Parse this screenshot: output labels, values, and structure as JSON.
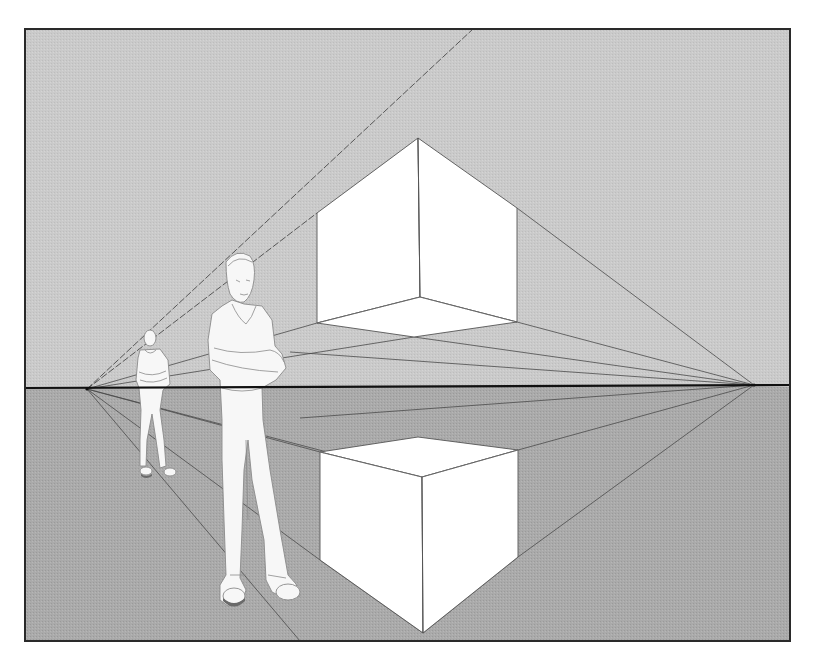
{
  "figure": {
    "colors": {
      "background": "#ffffff",
      "sky": "#c9c9c9",
      "ground": "#a9a9a9",
      "frame": "#2a2a2a",
      "horizon": "#111111",
      "cube_face": "#ffffff",
      "guide_line": "#4a4a4a"
    },
    "frame": {
      "left": 25,
      "top": 29,
      "right": 790,
      "bottom": 641
    },
    "horizon_y": 387,
    "vanishing_points": {
      "left": {
        "x": 87,
        "y": 389
      },
      "right": {
        "x": 754,
        "y": 385
      }
    },
    "upper_cube": {
      "top": {
        "x": 418,
        "y": 138
      },
      "left_top": {
        "x": 317,
        "y": 213
      },
      "right_top": {
        "x": 517,
        "y": 208
      },
      "left_bottom": {
        "x": 317,
        "y": 323
      },
      "right_bottom": {
        "x": 517,
        "y": 322
      },
      "inner_bottom": {
        "x": 420,
        "y": 297
      },
      "front_bottom": {
        "x": 414,
        "y": 337
      }
    },
    "lower_cube": {
      "back_top": {
        "x": 418,
        "y": 437
      },
      "left_top": {
        "x": 320,
        "y": 452
      },
      "right_top": {
        "x": 518,
        "y": 450
      },
      "front_top": {
        "x": 422,
        "y": 477
      },
      "left_bottom": {
        "x": 320,
        "y": 560
      },
      "right_bottom": {
        "x": 518,
        "y": 557
      },
      "front_bottom": {
        "x": 423,
        "y": 633
      }
    },
    "figures": [
      {
        "name": "near man, arms crossed",
        "x": 205,
        "y": 250,
        "height": 355
      },
      {
        "name": "far man, arms crossed",
        "x": 135,
        "y": 328,
        "height": 150
      }
    ]
  }
}
